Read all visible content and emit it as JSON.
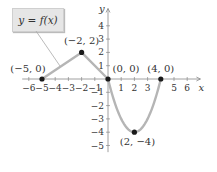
{
  "chart_data": {
    "type": "line",
    "title": "",
    "function_label": "y = f(x)",
    "xlabel": "x",
    "ylabel": "y",
    "xlim": [
      -6.5,
      7
    ],
    "ylim": [
      -5.5,
      5
    ],
    "x_ticks": [
      -6,
      -5,
      -4,
      -3,
      -2,
      -1,
      1,
      2,
      3,
      5,
      6
    ],
    "y_ticks": [
      -5,
      -4,
      -3,
      -2,
      -1,
      1,
      2,
      3,
      4
    ],
    "grid": false,
    "series": [
      {
        "name": "f(x)",
        "segments": [
          {
            "kind": "line",
            "points": [
              [
                -5,
                0
              ],
              [
                -2,
                2
              ]
            ]
          },
          {
            "kind": "line",
            "points": [
              [
                -2,
                2
              ],
              [
                0,
                0
              ]
            ]
          },
          {
            "kind": "parabola",
            "vertex": [
              2,
              -4
            ],
            "from": [
              0,
              0
            ],
            "to": [
              4,
              0
            ]
          }
        ],
        "color": "#b5b5b5"
      }
    ],
    "labeled_points": [
      {
        "x": -5,
        "y": 0,
        "label": "(−5, 0)"
      },
      {
        "x": -2,
        "y": 2,
        "label": "(−2, 2)"
      },
      {
        "x": 0,
        "y": 0,
        "label": "(0, 0)"
      },
      {
        "x": 4,
        "y": 0,
        "label": "(4, 0)"
      },
      {
        "x": 2,
        "y": -4,
        "label": "(2, −4)"
      }
    ]
  },
  "colors": {
    "curve": "#b5b5b5",
    "axis": "#888888",
    "point": "#1a1a1a",
    "label_box": "#e6e6e6"
  }
}
